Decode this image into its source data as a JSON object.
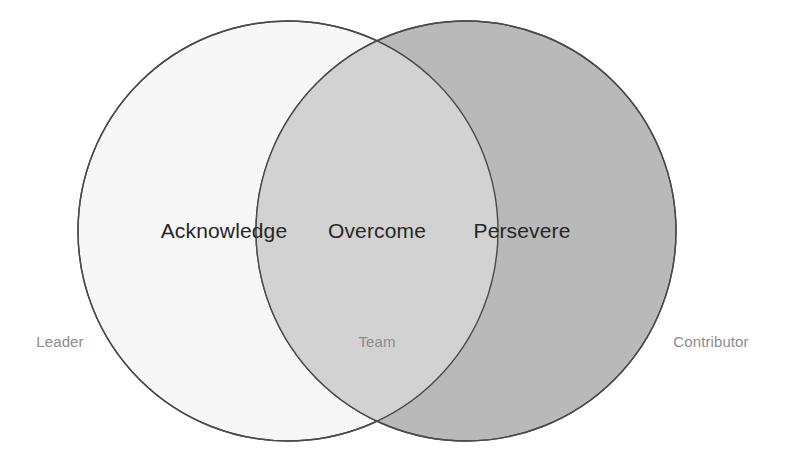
{
  "diagram": {
    "type": "venn",
    "title": "",
    "background_color": "#ffffff",
    "stroke_color": "#4a4a4a",
    "sets": [
      {
        "id": "left",
        "label": "Acknowledge",
        "caption": "Leader",
        "fill_color": "#f7f7f7",
        "center_x": 288,
        "center_y": 231,
        "radius": 210
      },
      {
        "id": "right",
        "label": "Persevere",
        "caption": "Contributor",
        "fill_color": "#b9b9b9",
        "center_x": 466,
        "center_y": 231,
        "radius": 210
      }
    ],
    "intersection": {
      "id": "overlap",
      "label": "Overcome",
      "caption": "Team",
      "fill_color": "#d2d2d2",
      "center_x": 377,
      "center_y": 231
    },
    "label_color": "#262626",
    "caption_color": "#8c8c8c"
  }
}
